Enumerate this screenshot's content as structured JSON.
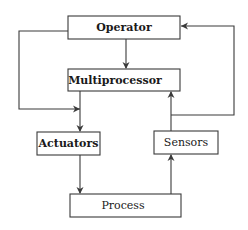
{
  "diagram": {
    "type": "block-diagram",
    "nodes": {
      "operator": {
        "label": "Operator",
        "x": 68,
        "y": 16,
        "w": 112,
        "h": 23
      },
      "multiprocessor": {
        "label": "Multiprocessor",
        "x": 68,
        "y": 69,
        "w": 112,
        "h": 22
      },
      "actuators": {
        "label": "Actuators",
        "x": 37,
        "y": 132,
        "w": 63,
        "h": 23
      },
      "sensors": {
        "label": "Sensors",
        "x": 154,
        "y": 131,
        "w": 64,
        "h": 23
      },
      "process": {
        "label": "Process",
        "x": 70,
        "y": 194,
        "w": 111,
        "h": 23
      }
    },
    "edges": [
      {
        "from": "operator",
        "to": "multiprocessor"
      },
      {
        "from": "operator",
        "to": "actuators",
        "route": "left-loop"
      },
      {
        "from": "multiprocessor",
        "to": "actuators"
      },
      {
        "from": "actuators",
        "to": "process"
      },
      {
        "from": "process",
        "to": "sensors"
      },
      {
        "from": "sensors",
        "to": "multiprocessor"
      },
      {
        "from": "sensors",
        "to": "operator",
        "route": "right-loop"
      }
    ],
    "colors": {
      "stroke": "#3a3a3a",
      "text": "#1a1a1a",
      "background": "#ffffff"
    }
  }
}
